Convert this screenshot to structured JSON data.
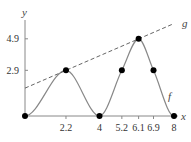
{
  "chart_data": {
    "type": "line",
    "title": "",
    "xlabel": "x",
    "ylabel": "y",
    "xlim": [
      0,
      8
    ],
    "ylim": [
      0,
      5.9
    ],
    "grid": false,
    "x_ticks": [
      2.2,
      4,
      5.2,
      6.1,
      6.9,
      8
    ],
    "x_tick_labels": [
      "2.2",
      "4",
      "5.2",
      "6.1",
      "6.9",
      "8"
    ],
    "y_ticks": [
      2.9,
      4.9
    ],
    "y_tick_labels": [
      "2.9",
      "4.9"
    ],
    "series": [
      {
        "name": "f",
        "style": "solid",
        "color": "#888888",
        "smooth": true,
        "points": [
          {
            "x": 0,
            "y": 0
          },
          {
            "x": 2.2,
            "y": 2.9
          },
          {
            "x": 4,
            "y": 0
          },
          {
            "x": 5.2,
            "y": 2.9
          },
          {
            "x": 6.1,
            "y": 4.9
          },
          {
            "x": 6.9,
            "y": 2.9
          },
          {
            "x": 8,
            "y": 0
          }
        ],
        "markers": [
          {
            "x": 0,
            "y": 0
          },
          {
            "x": 2.2,
            "y": 2.9
          },
          {
            "x": 4,
            "y": 0
          },
          {
            "x": 5.2,
            "y": 2.9
          },
          {
            "x": 6.1,
            "y": 4.9
          },
          {
            "x": 6.9,
            "y": 2.9
          },
          {
            "x": 8,
            "y": 0
          }
        ]
      },
      {
        "name": "g",
        "style": "dashed",
        "color": "#555555",
        "points": [
          {
            "x": 0,
            "y": 1.77
          },
          {
            "x": 8,
            "y": 5.87
          }
        ]
      }
    ],
    "annotations": [
      {
        "text": "f",
        "near": "f curve, right descending side"
      },
      {
        "text": "g",
        "near": "end of dashed line, top-right"
      }
    ],
    "colors": {
      "axis": "#888888",
      "marker": "#000000",
      "text": "#333333"
    }
  }
}
